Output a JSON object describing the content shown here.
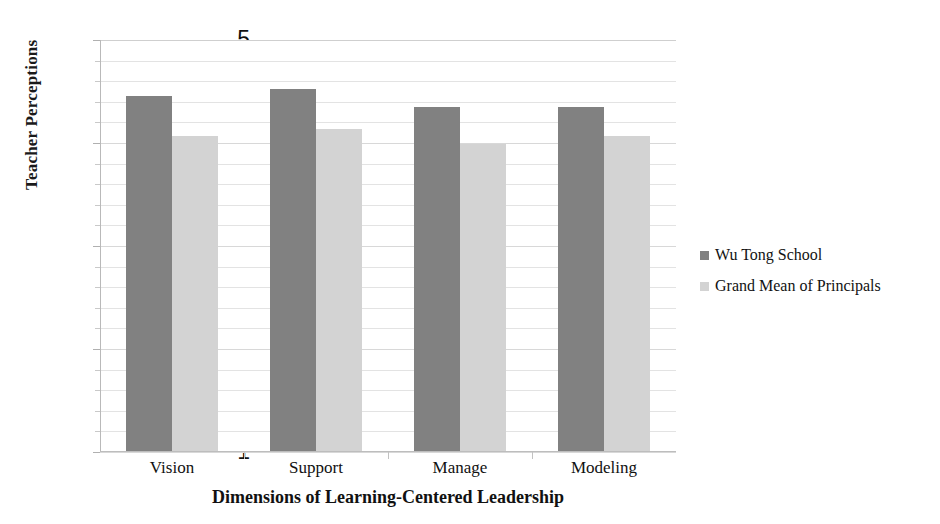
{
  "chart_data": {
    "type": "bar",
    "title": "",
    "xlabel": "Dimensions of Learning-Centered Leadership",
    "ylabel": "Teacher Perceptions",
    "categories": [
      "Vision",
      "Support",
      "Manage",
      "Modeling"
    ],
    "series": [
      {
        "name": "Wu Tong School",
        "color": "#818181",
        "values": [
          4.46,
          4.52,
          4.35,
          4.35
        ]
      },
      {
        "name": "Grand Mean of Principals",
        "color": "#d3d3d3",
        "values": [
          4.07,
          4.14,
          3.99,
          4.07
        ]
      }
    ],
    "ylim": [
      1,
      5
    ],
    "ytick_labels": [
      "5",
      "4",
      "3",
      "2",
      "1"
    ],
    "ytick_values": [
      5,
      4,
      3,
      2,
      1
    ],
    "ytick_minor_step": 0.2,
    "grid": true,
    "grid_axis": "y",
    "legend_position": "right"
  },
  "legend": {
    "entries": [
      {
        "label": "Wu Tong School"
      },
      {
        "label": "Grand Mean of Principals"
      }
    ]
  },
  "axes": {
    "y_title": "Teacher Perceptions",
    "x_title": "Dimensions of Learning-Centered Leadership"
  }
}
